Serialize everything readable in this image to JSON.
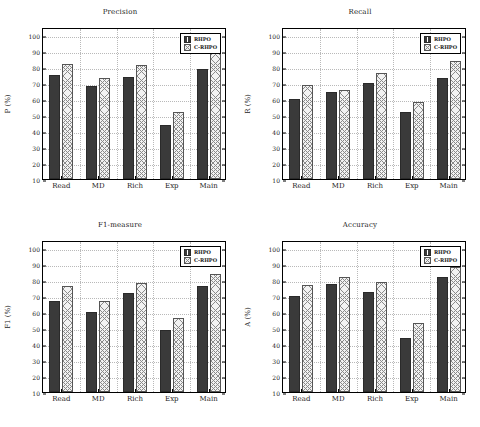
{
  "figure": {
    "legend": {
      "series": [
        "RHPO",
        "C-RHPO"
      ]
    },
    "axis": {
      "ticks": [
        10,
        20,
        30,
        40,
        50,
        60,
        70,
        80,
        90,
        100
      ],
      "ymin": 10,
      "ymax": 105,
      "categories": [
        "Read",
        "MD",
        "Rich",
        "Exp",
        "Main"
      ]
    },
    "colors": {
      "series0": "#3a3a3a",
      "series1": "#f2f2f2",
      "hatch": "#8a8a8a",
      "grid": "#b9b9b9",
      "axis": "#000000"
    }
  },
  "chart_data": [
    {
      "type": "bar",
      "title": "Precision",
      "xlabel": "",
      "ylabel": "P (%)",
      "ylim": [
        10,
        105
      ],
      "yticks": [
        10,
        20,
        30,
        40,
        50,
        60,
        70,
        80,
        90,
        100
      ],
      "grid": true,
      "legend_position": "top-right",
      "categories": [
        "Read",
        "MD",
        "Rich",
        "Exp",
        "Main"
      ],
      "series": [
        {
          "name": "RHPO",
          "values": [
            75,
            68,
            74,
            44,
            79
          ]
        },
        {
          "name": "C-RHPO",
          "values": [
            82,
            73,
            81,
            52,
            89
          ]
        }
      ]
    },
    {
      "type": "bar",
      "title": "Recall",
      "xlabel": "",
      "ylabel": "R (%)",
      "ylim": [
        10,
        105
      ],
      "yticks": [
        10,
        20,
        30,
        40,
        50,
        60,
        70,
        80,
        90,
        100
      ],
      "grid": true,
      "legend_position": "top-right",
      "categories": [
        "Read",
        "MD",
        "Rich",
        "Exp",
        "Main"
      ],
      "series": [
        {
          "name": "RHPO",
          "values": [
            60,
            64.5,
            70,
            52,
            73
          ]
        },
        {
          "name": "C-RHPO",
          "values": [
            69,
            65.5,
            76,
            58,
            84
          ]
        }
      ]
    },
    {
      "type": "bar",
      "title": "F1-measure",
      "xlabel": "",
      "ylabel": "F1 (%)",
      "ylim": [
        10,
        105
      ],
      "yticks": [
        10,
        20,
        30,
        40,
        50,
        60,
        70,
        80,
        90,
        100
      ],
      "grid": true,
      "legend_position": "top-right",
      "categories": [
        "Read",
        "MD",
        "Rich",
        "Exp",
        "Main"
      ],
      "series": [
        {
          "name": "RHPO",
          "values": [
            67,
            60,
            72,
            49,
            76
          ]
        },
        {
          "name": "C-RHPO",
          "values": [
            76,
            67,
            78,
            56,
            84
          ]
        }
      ]
    },
    {
      "type": "bar",
      "title": "Accuracy",
      "xlabel": "",
      "ylabel": "A (%)",
      "ylim": [
        10,
        105
      ],
      "yticks": [
        10,
        20,
        30,
        40,
        50,
        60,
        70,
        80,
        90,
        100
      ],
      "grid": true,
      "legend_position": "top-right",
      "categories": [
        "Read",
        "MD",
        "Rich",
        "Exp",
        "Main"
      ],
      "series": [
        {
          "name": "RHPO",
          "values": [
            70,
            77.5,
            72.5,
            44,
            82
          ]
        },
        {
          "name": "C-RHPO",
          "values": [
            77,
            82,
            79,
            53,
            88
          ]
        }
      ]
    }
  ]
}
